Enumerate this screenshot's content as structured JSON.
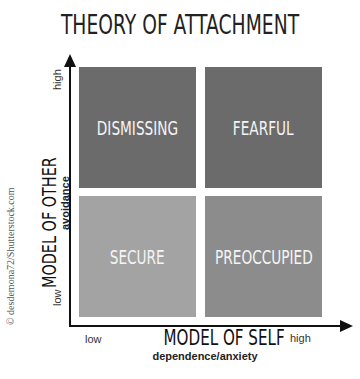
{
  "title": "THEORY OF ATTACHMENT",
  "y_axis": {
    "label": "MODEL OF OTHER",
    "sublabel": "avoidance",
    "high": "high",
    "low": "low"
  },
  "x_axis": {
    "label": "MODEL OF SELF",
    "sublabel": "dependence/anxiety",
    "low": "low",
    "high": "high"
  },
  "quadrants": [
    {
      "label": "DISMISSING",
      "position": "top-left",
      "color": "#6b6b6b"
    },
    {
      "label": "FEARFUL",
      "position": "top-right",
      "color": "#6b6b6b"
    },
    {
      "label": "SECURE",
      "position": "bottom-left",
      "color": "#a3a3a3"
    },
    {
      "label": "PREOCCUPIED",
      "position": "bottom-right",
      "color": "#8c8c8c"
    }
  ],
  "credit": "© desdemona72/Shutterstock.com"
}
